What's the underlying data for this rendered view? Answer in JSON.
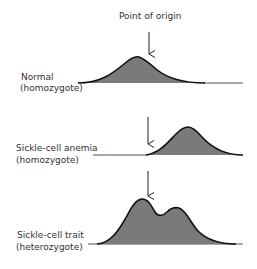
{
  "title": "Point of origin",
  "rows": [
    {
      "label1": "Normal",
      "label2": "(homozygote)"
    },
    {
      "label1": "Sickle-cell anemia",
      "label2": "(homozygote)"
    },
    {
      "label1": "Sickle-cell trait",
      "label2": "(heterozygote)"
    }
  ],
  "colors": {
    "fill": "#7a7a7a",
    "stroke": "#111111",
    "baseline": "#555555"
  }
}
